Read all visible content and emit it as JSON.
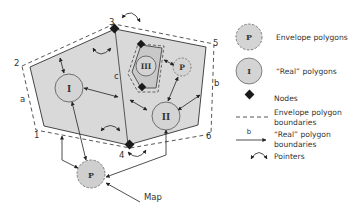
{
  "diagram": {
    "vertex_labels": [
      "1",
      "2",
      "3",
      "4",
      "5",
      "6"
    ],
    "edge_labels": {
      "a": "a",
      "b": "b",
      "c": "c"
    },
    "polygons": {
      "real_1": "I",
      "real_2": "II",
      "real_3": "III",
      "envelope_inner": "P",
      "envelope_map": "P"
    },
    "map_label": "Map"
  },
  "legend": {
    "items": [
      {
        "symbol": "P",
        "label": "Envelope polygons"
      },
      {
        "symbol": "I",
        "label": "“Real” polygons"
      },
      {
        "symbol": "",
        "label": "Nodes"
      },
      {
        "symbol": "",
        "label_line1": "Envelope polygon",
        "label_line2": "boundaries"
      },
      {
        "symbol": "b",
        "label_line1": "“Real” polygon",
        "label_line2": "boundaries"
      },
      {
        "symbol": "",
        "label": "Pointers"
      }
    ]
  },
  "colors": {
    "polygon_fill": "#d9d9d9",
    "circle_fill": "#d4d4d4",
    "line": "#333333",
    "node": "#1a1a1a"
  }
}
